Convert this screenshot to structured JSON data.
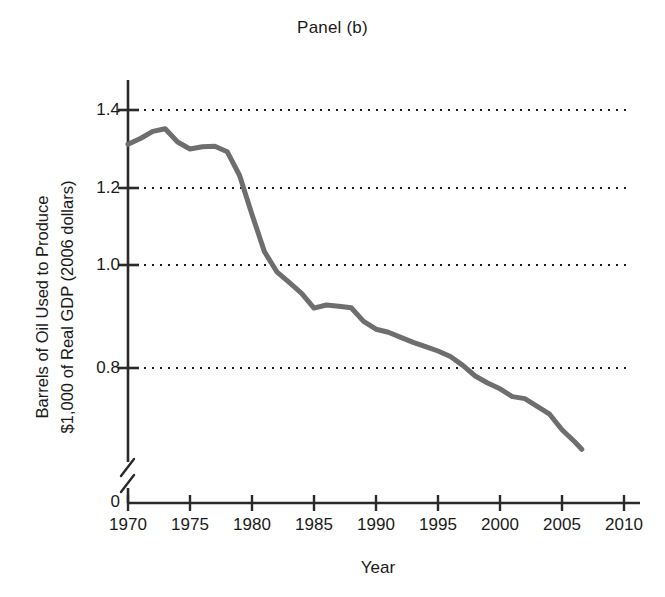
{
  "chart_data": {
    "type": "line",
    "title": "Panel (b)",
    "xlabel": "Year",
    "ylabel": "Barrels of Oil Used to Produce\n$1,000 of Real GDP (2006 dollars)",
    "xlim": [
      1970,
      2010
    ],
    "ylim": [
      0,
      1.45
    ],
    "grid": "horizontal-dotted",
    "legend": "none",
    "axis_break": {
      "axis": "y",
      "between": [
        0.0,
        0.72
      ],
      "symbol": "zigzag"
    },
    "xticks": [
      1970,
      1975,
      1980,
      1985,
      1990,
      1995,
      2000,
      2005,
      2010
    ],
    "xtick_labels": [
      "1970",
      "1975",
      "1980",
      "1985",
      "1990",
      "1995",
      "2000",
      "2005",
      "2010"
    ],
    "yticks": [
      0,
      0.8,
      1.0,
      1.2,
      1.4
    ],
    "ytick_labels": [
      "0",
      "0.8",
      "1.0",
      "1.2",
      "1.4"
    ],
    "series": [
      {
        "name": "Barrels of oil per $1,000 of real GDP",
        "color": "#6e6e6e",
        "line_width": 5,
        "x": [
          1970,
          1971,
          1972,
          1973,
          1974,
          1975,
          1976,
          1977,
          1978,
          1979,
          1980,
          1981,
          1982,
          1983,
          1984,
          1985,
          1986,
          1987,
          1988,
          1989,
          1990,
          1991,
          1992,
          1993,
          1994,
          1995,
          1996,
          1997,
          1998,
          1999,
          2000,
          2001,
          2002,
          2003,
          2004,
          2005,
          2006,
          2006.6
        ],
        "values": [
          1.312,
          1.327,
          1.345,
          1.352,
          1.318,
          1.3,
          1.306,
          1.307,
          1.293,
          1.232,
          1.132,
          1.037,
          0.985,
          0.958,
          0.93,
          0.892,
          0.9,
          0.897,
          0.893,
          0.858,
          0.838,
          0.83,
          0.817,
          0.804,
          0.793,
          0.782,
          0.768,
          0.745,
          0.718,
          0.7,
          0.685,
          0.665,
          0.66,
          0.64,
          0.62,
          0.58,
          0.55,
          0.53
        ]
      }
    ]
  },
  "note": {
    "ylabel_line1": "Barrels of Oil Used to Produce",
    "ylabel_line2": "$1,000 of Real GDP (2006 dollars)"
  }
}
